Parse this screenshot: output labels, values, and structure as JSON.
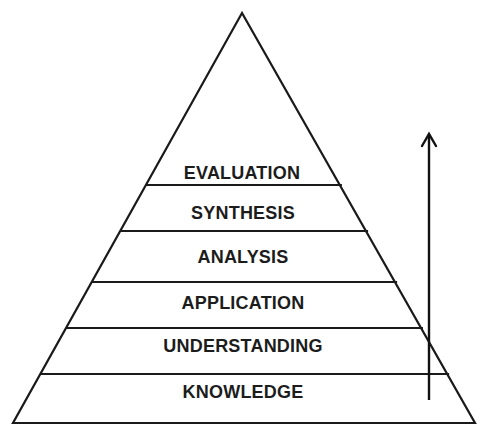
{
  "diagram": {
    "type": "pyramid",
    "title": "",
    "levels_top_to_bottom": [
      {
        "label": "EVALUATION"
      },
      {
        "label": "SYNTHESIS"
      },
      {
        "label": "ANALYSIS"
      },
      {
        "label": "APPLICATION"
      },
      {
        "label": "UNDERSTANDING"
      },
      {
        "label": "KNOWLEDGE"
      }
    ],
    "arrow": {
      "direction": "up",
      "meaning": "increasing level"
    },
    "colors": {
      "stroke": "#1a1a1a",
      "text": "#1c1c1c",
      "background": "#ffffff"
    }
  }
}
